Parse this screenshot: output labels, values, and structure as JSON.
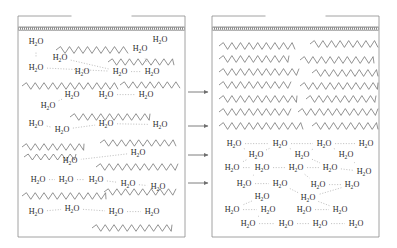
{
  "figure": {
    "title": "",
    "molecule_label": "H2O",
    "panels": [
      {
        "name": "disordered-state",
        "caption": "",
        "box": {
          "x": 18,
          "y": 16,
          "w": 167,
          "h": 221
        },
        "wall_label": "hatched-interface",
        "chains": [
          {
            "x": 56,
            "y": 50,
            "len": 72,
            "amp": 3.4,
            "period": 9.0
          },
          {
            "x": 108,
            "y": 62,
            "len": 66,
            "amp": 3.2,
            "period": 8.6
          },
          {
            "x": 22,
            "y": 86,
            "len": 96,
            "amp": 3.3,
            "period": 8.8
          },
          {
            "x": 120,
            "y": 85,
            "len": 60,
            "amp": 3.2,
            "period": 8.6
          },
          {
            "x": 70,
            "y": 117,
            "len": 80,
            "amp": 3.3,
            "period": 8.8
          },
          {
            "x": 22,
            "y": 147,
            "len": 62,
            "amp": 3.3,
            "period": 8.8
          },
          {
            "x": 100,
            "y": 143,
            "len": 76,
            "amp": 3.2,
            "period": 8.6
          },
          {
            "x": 24,
            "y": 157,
            "len": 52,
            "amp": 3.0,
            "period": 8.4
          },
          {
            "x": 96,
            "y": 167,
            "len": 82,
            "amp": 3.3,
            "period": 8.8
          },
          {
            "x": 22,
            "y": 196,
            "len": 84,
            "amp": 3.3,
            "period": 8.8
          },
          {
            "x": 104,
            "y": 192,
            "len": 72,
            "amp": 3.2,
            "period": 8.6
          },
          {
            "x": 92,
            "y": 228,
            "len": 80,
            "amp": 3.3,
            "period": 8.8
          }
        ],
        "waters": [
          {
            "x": 36,
            "y": 44
          },
          {
            "x": 160,
            "y": 42
          },
          {
            "x": 140,
            "y": 51
          },
          {
            "x": 60,
            "y": 60
          },
          {
            "x": 36,
            "y": 70
          },
          {
            "x": 82,
            "y": 74
          },
          {
            "x": 120,
            "y": 74
          },
          {
            "x": 152,
            "y": 74
          },
          {
            "x": 72,
            "y": 97
          },
          {
            "x": 106,
            "y": 97
          },
          {
            "x": 146,
            "y": 97
          },
          {
            "x": 48,
            "y": 108
          },
          {
            "x": 36,
            "y": 126
          },
          {
            "x": 62,
            "y": 132
          },
          {
            "x": 106,
            "y": 126
          },
          {
            "x": 160,
            "y": 127
          },
          {
            "x": 138,
            "y": 155
          },
          {
            "x": 70,
            "y": 163
          },
          {
            "x": 38,
            "y": 182
          },
          {
            "x": 66,
            "y": 182
          },
          {
            "x": 96,
            "y": 182
          },
          {
            "x": 128,
            "y": 186
          },
          {
            "x": 158,
            "y": 189
          },
          {
            "x": 36,
            "y": 214
          },
          {
            "x": 72,
            "y": 211
          },
          {
            "x": 116,
            "y": 214
          },
          {
            "x": 152,
            "y": 214
          }
        ],
        "bonds": [
          [
            0,
            4
          ],
          [
            1,
            2
          ],
          [
            3,
            6
          ],
          [
            4,
            6
          ],
          [
            6,
            7
          ],
          [
            7,
            2
          ],
          [
            8,
            11
          ],
          [
            9,
            10
          ],
          [
            11,
            12
          ],
          [
            12,
            13
          ],
          [
            13,
            14
          ],
          [
            14,
            15
          ],
          [
            16,
            17
          ],
          [
            17,
            19
          ],
          [
            18,
            19
          ],
          [
            19,
            20
          ],
          [
            20,
            21
          ],
          [
            21,
            22
          ],
          [
            23,
            24
          ],
          [
            24,
            25
          ],
          [
            25,
            26
          ]
        ]
      },
      {
        "name": "ordered-state",
        "caption": "",
        "box": {
          "x": 212,
          "y": 16,
          "w": 167,
          "h": 221
        },
        "wall_label": "hatched-interface",
        "chains": [
          {
            "x": 219,
            "y": 46,
            "len": 76,
            "amp": 3.4,
            "period": 8.6
          },
          {
            "x": 310,
            "y": 44,
            "len": 68,
            "amp": 3.4,
            "period": 8.6
          },
          {
            "x": 219,
            "y": 59,
            "len": 70,
            "amp": 3.4,
            "period": 8.6
          },
          {
            "x": 300,
            "y": 60,
            "len": 74,
            "amp": 3.4,
            "period": 8.6
          },
          {
            "x": 219,
            "y": 72,
            "len": 80,
            "amp": 3.4,
            "period": 8.6
          },
          {
            "x": 312,
            "y": 73,
            "len": 66,
            "amp": 3.4,
            "period": 8.6
          },
          {
            "x": 219,
            "y": 85,
            "len": 72,
            "amp": 3.4,
            "period": 8.6
          },
          {
            "x": 300,
            "y": 86,
            "len": 78,
            "amp": 3.4,
            "period": 8.6
          },
          {
            "x": 219,
            "y": 99,
            "len": 78,
            "amp": 3.4,
            "period": 8.6
          },
          {
            "x": 306,
            "y": 99,
            "len": 70,
            "amp": 3.4,
            "period": 8.6
          },
          {
            "x": 219,
            "y": 112,
            "len": 72,
            "amp": 3.4,
            "period": 8.6
          },
          {
            "x": 298,
            "y": 112,
            "len": 80,
            "amp": 3.4,
            "period": 8.6
          },
          {
            "x": 219,
            "y": 126,
            "len": 84,
            "amp": 3.4,
            "period": 8.6
          },
          {
            "x": 312,
            "y": 126,
            "len": 66,
            "amp": 3.4,
            "period": 8.6
          }
        ],
        "waters": [
          {
            "x": 234,
            "y": 146
          },
          {
            "x": 280,
            "y": 146
          },
          {
            "x": 324,
            "y": 146
          },
          {
            "x": 366,
            "y": 146
          },
          {
            "x": 256,
            "y": 157
          },
          {
            "x": 302,
            "y": 157
          },
          {
            "x": 346,
            "y": 157
          },
          {
            "x": 232,
            "y": 170
          },
          {
            "x": 262,
            "y": 170
          },
          {
            "x": 296,
            "y": 170
          },
          {
            "x": 330,
            "y": 170
          },
          {
            "x": 364,
            "y": 174
          },
          {
            "x": 244,
            "y": 186
          },
          {
            "x": 280,
            "y": 186
          },
          {
            "x": 318,
            "y": 187
          },
          {
            "x": 352,
            "y": 187
          },
          {
            "x": 262,
            "y": 199
          },
          {
            "x": 308,
            "y": 200
          },
          {
            "x": 232,
            "y": 212
          },
          {
            "x": 268,
            "y": 212
          },
          {
            "x": 304,
            "y": 212
          },
          {
            "x": 340,
            "y": 212
          },
          {
            "x": 248,
            "y": 226
          },
          {
            "x": 286,
            "y": 226
          },
          {
            "x": 320,
            "y": 226
          },
          {
            "x": 356,
            "y": 226
          }
        ],
        "bonds": [
          [
            0,
            1
          ],
          [
            1,
            2
          ],
          [
            2,
            3
          ],
          [
            0,
            4
          ],
          [
            4,
            1
          ],
          [
            1,
            5
          ],
          [
            5,
            2
          ],
          [
            2,
            6
          ],
          [
            6,
            3
          ],
          [
            4,
            7
          ],
          [
            4,
            8
          ],
          [
            5,
            9
          ],
          [
            5,
            10
          ],
          [
            6,
            10
          ],
          [
            6,
            11
          ],
          [
            7,
            12
          ],
          [
            8,
            12
          ],
          [
            9,
            13
          ],
          [
            9,
            14
          ],
          [
            10,
            14
          ],
          [
            11,
            15
          ],
          [
            12,
            16
          ],
          [
            13,
            16
          ],
          [
            13,
            17
          ],
          [
            14,
            17
          ],
          [
            15,
            17
          ],
          [
            16,
            18
          ],
          [
            16,
            19
          ],
          [
            17,
            20
          ],
          [
            17,
            21
          ],
          [
            18,
            22
          ],
          [
            19,
            22
          ],
          [
            19,
            23
          ],
          [
            20,
            23
          ],
          [
            20,
            24
          ],
          [
            21,
            25
          ],
          [
            22,
            23
          ],
          [
            23,
            24
          ],
          [
            24,
            25
          ],
          [
            7,
            8
          ],
          [
            8,
            9
          ],
          [
            9,
            10
          ],
          [
            10,
            11
          ],
          [
            12,
            13
          ],
          [
            14,
            15
          ],
          [
            18,
            19
          ],
          [
            20,
            21
          ]
        ]
      }
    ],
    "arrows": [
      {
        "x1": 188,
        "y1": 92,
        "x2": 208,
        "y2": 92
      },
      {
        "x1": 188,
        "y1": 126,
        "x2": 208,
        "y2": 126
      },
      {
        "x1": 188,
        "y1": 155,
        "x2": 208,
        "y2": 155
      },
      {
        "x1": 188,
        "y1": 183,
        "x2": 208,
        "y2": 183
      }
    ],
    "colors": {
      "line": "#6f6f6f",
      "text": "#2b2b2b",
      "frame": "#8a8a8a",
      "bond": "#a8a8a8",
      "hatch": "#555555",
      "background": "#ffffff"
    }
  }
}
